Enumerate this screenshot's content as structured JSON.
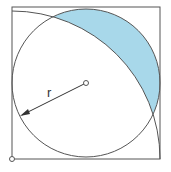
{
  "diagram": {
    "label_radius": "r",
    "colors": {
      "stroke": "#555555",
      "shaded_fill": "#a8d8ea",
      "background": "#ffffff"
    },
    "shapes": {
      "square": {
        "x": 12,
        "y": 7,
        "side": 148
      },
      "inscribed_circle": {
        "cx": 86,
        "cy": 83,
        "r": 74
      },
      "quarter_arc": {
        "cx": 12,
        "cy": 159,
        "r": 148
      },
      "center_point": {
        "cx": 86,
        "cy": 83
      },
      "corner_point": {
        "cx": 12,
        "cy": 159
      }
    },
    "shaded_region": "region inside inscribed circle and outside quarter-circle arc"
  }
}
